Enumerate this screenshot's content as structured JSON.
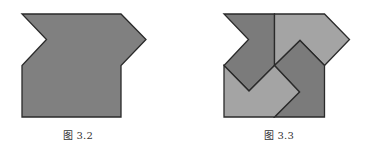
{
  "figures": [
    {
      "id": "figure-3-2",
      "caption": "图 3.2",
      "description": "Single gray polygon: square body with a V-notch on the left top and an arrow tip on the right top",
      "pieces": [
        {
          "name": "whole-shape",
          "fill": "#808080",
          "points": "22,14 121,14 146,39.5 121,65.5 121,117 22,117 22,65.5 46.5,39.5"
        }
      ]
    },
    {
      "id": "figure-3-3",
      "caption": "图 3.3",
      "description": "Same outline dissected into four congruent pieces in a pinwheel arrangement, alternating dark and light gray",
      "pieces": [
        {
          "name": "piece-top-left",
          "fill": "#7b7b7b",
          "points": "224,14 274.5,14 274.5,65.5 249,91 224,65.5 248.5,39.5"
        },
        {
          "name": "piece-top-right",
          "fill": "#a4a4a4",
          "points": "274.5,14 324.5,14 349.5,39.5 324.5,65.5 300,40.5 274.5,65.5"
        },
        {
          "name": "piece-bottom-right",
          "fill": "#7b7b7b",
          "points": "274.5,65.5 300,40.5 324.5,65.5 324.5,117 274.5,117 299.5,92"
        },
        {
          "name": "piece-bottom-left",
          "fill": "#a4a4a4",
          "points": "224,65.5 249,91 274.5,65.5 299.5,92 274.5,117 224,117"
        }
      ]
    }
  ],
  "style": {
    "stroke": "#2a2a2a",
    "stroke_width": 1.3,
    "background": "#ffffff"
  }
}
